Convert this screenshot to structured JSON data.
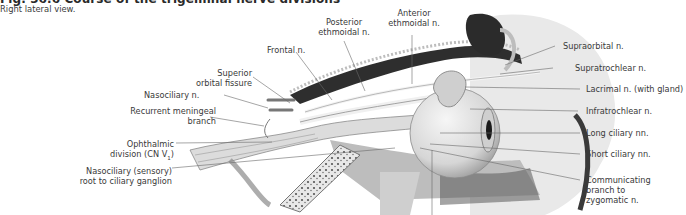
{
  "figure": {
    "title": "Fig. 36.6  Course of the trigeminal nerve divisions",
    "subtitle": "Right lateral view."
  },
  "labels": {
    "left": [
      {
        "id": "nasociliary",
        "text": "Nasociliary n."
      },
      {
        "id": "recurrent_meningeal",
        "line1": "Recurrent meningeal",
        "line2": "branch"
      },
      {
        "id": "ophthalmic",
        "line1": "Ophthalmic",
        "line2": "division (CN V",
        "sub": "1",
        "line2_end": ")"
      },
      {
        "id": "nasociliary_root",
        "line1": "Nasociliary (sensory)",
        "line2": "root to ciliary ganglion"
      }
    ],
    "top": [
      {
        "id": "superior_orbital_fissure",
        "line1": "Superior",
        "line2": "orbital fissure"
      },
      {
        "id": "frontal",
        "text": "Frontal n."
      },
      {
        "id": "posterior_ethmoidal",
        "line1": "Posterior",
        "line2": "ethmoidal n."
      },
      {
        "id": "anterior_ethmoidal",
        "line1": "Anterior",
        "line2": "ethmoidal n."
      }
    ],
    "right": [
      {
        "id": "supraorbital",
        "text": "Supraorbital n."
      },
      {
        "id": "supratrochlear",
        "text": "Supratrochlear n."
      },
      {
        "id": "lacrimal",
        "text": "Lacrimal n. (with gland)"
      },
      {
        "id": "infratrochlear",
        "text": "Infratrochlear n."
      },
      {
        "id": "long_ciliary",
        "text": "Long ciliary nn."
      },
      {
        "id": "short_ciliary",
        "text": "Short ciliary nn."
      },
      {
        "id": "communicating",
        "line1": "Communicating",
        "line2": "branch to",
        "line3": "zygomatic n."
      }
    ]
  },
  "colors": {
    "leader_line": "#6a6a6a",
    "bone": "#9a9a9a",
    "eyeball": "#e4e4e4",
    "nerve": "#d8d8d8",
    "dark": "#2b2b2b"
  }
}
